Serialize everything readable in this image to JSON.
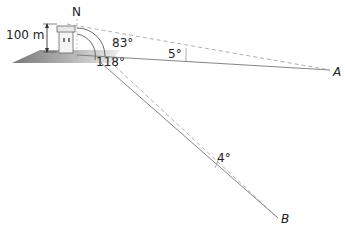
{
  "diagram": {
    "height_label": "100 m",
    "north_label": "N",
    "angle_bearing_A": "83°",
    "angle_bearing_B": "118°",
    "angle_depression_A": "5°",
    "angle_depression_B": "4°",
    "point_A": "A",
    "point_B": "B"
  }
}
